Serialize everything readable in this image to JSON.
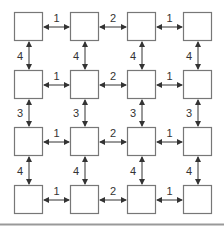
{
  "diagram": {
    "rows": 4,
    "cols": 4,
    "node_color": "#777777",
    "edge_color": "#333333",
    "horizontal_weights": [
      "1",
      "2",
      "1"
    ],
    "vertical_weights": [
      "4",
      "3",
      "4"
    ],
    "edges": {
      "h": [
        [
          "1",
          "2",
          "1"
        ],
        [
          "1",
          "2",
          "1"
        ],
        [
          "1",
          "2",
          "1"
        ],
        [
          "1",
          "2",
          "1"
        ]
      ],
      "v": [
        [
          "4",
          "4",
          "4",
          "4"
        ],
        [
          "3",
          "3",
          "3",
          "3"
        ],
        [
          "4",
          "4",
          "4",
          "4"
        ]
      ]
    }
  }
}
